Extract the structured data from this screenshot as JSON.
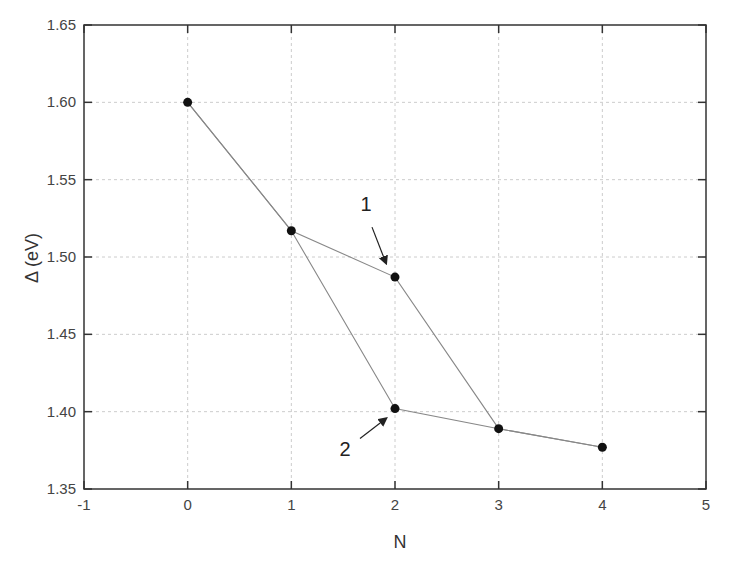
{
  "chart_data": {
    "type": "line",
    "title": "",
    "xlabel": "N",
    "ylabel": "Δ (eV)",
    "xlim": [
      -1,
      5
    ],
    "ylim": [
      1.35,
      1.65
    ],
    "xticks": [
      "-1",
      "0",
      "1",
      "2",
      "3",
      "4",
      "5"
    ],
    "yticks": [
      "1.35",
      "1.40",
      "1.45",
      "1.50",
      "1.55",
      "1.60",
      "1.65"
    ],
    "grid": true,
    "series": [
      {
        "name": "1",
        "x": [
          0,
          1,
          2,
          3,
          4
        ],
        "y": [
          1.6,
          1.517,
          1.487,
          1.389,
          1.377
        ]
      },
      {
        "name": "2",
        "x": [
          0,
          1,
          2,
          3,
          4
        ],
        "y": [
          1.6,
          1.517,
          1.402,
          1.389,
          1.377
        ]
      }
    ],
    "annotations": [
      {
        "text": "1",
        "points_to": {
          "x": 2,
          "y": 1.487
        }
      },
      {
        "text": "2",
        "points_to": {
          "x": 2,
          "y": 1.402
        }
      }
    ]
  },
  "colors": {
    "line": "#888888",
    "marker": "#111111",
    "grid": "#cccccc",
    "axis": "#333333"
  }
}
